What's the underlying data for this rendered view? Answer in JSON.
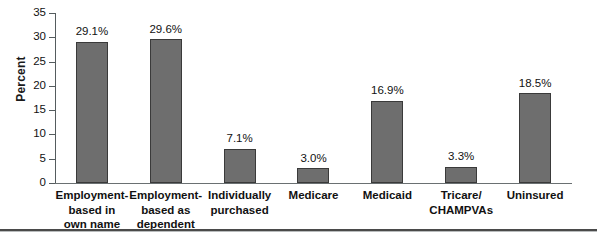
{
  "chart_data": {
    "type": "bar",
    "title": "",
    "xlabel": "",
    "ylabel": "Percent",
    "ylim": [
      0,
      35
    ],
    "ytick_step": 5,
    "yticks": [
      35,
      30,
      25,
      20,
      15,
      10,
      5,
      0
    ],
    "grid": false,
    "legend": null,
    "bar_color": "#6e6e6e",
    "bar_edge_color": "#3a3a3a",
    "axis_color": "#555c5e",
    "categories": [
      "Employment-based in own name",
      "Employment-based as dependent",
      "Individually purchased",
      "Medicare",
      "Medicaid",
      "Tricare/CHAMPVAs",
      "Uninsured"
    ],
    "category_lines": [
      [
        "Employment-",
        "based in",
        "own name"
      ],
      [
        "Employment-",
        "based as",
        "dependent"
      ],
      [
        "Individually",
        "purchased"
      ],
      [
        "Medicare"
      ],
      [
        "Medicaid"
      ],
      [
        "Tricare/",
        "CHAMPVAs"
      ],
      [
        "Uninsured"
      ]
    ],
    "values": [
      29.1,
      29.6,
      7.1,
      3.0,
      16.9,
      3.3,
      18.5
    ],
    "data_labels": [
      "29.1%",
      "29.6%",
      "7.1%",
      "3.0%",
      "16.9%",
      "3.3%",
      "18.5%"
    ]
  }
}
